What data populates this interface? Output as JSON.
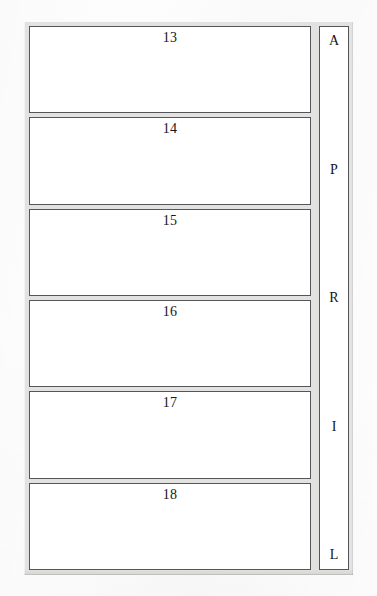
{
  "page": {
    "background_color": "#fdfdfd",
    "frame_color": "#e2e2e1",
    "box_border_color": "#56565a",
    "box_fill_color": "#ffffff",
    "text_color": "#16161a"
  },
  "form": {
    "boxes": [
      {
        "number": "13"
      },
      {
        "number": "14"
      },
      {
        "number": "15"
      },
      {
        "number": "16"
      },
      {
        "number": "17"
      },
      {
        "number": "18"
      }
    ],
    "month_column": {
      "word": "APRIL",
      "letters": [
        {
          "letter": "A"
        },
        {
          "letter": "P"
        },
        {
          "letter": "R"
        },
        {
          "letter": "I"
        },
        {
          "letter": "L"
        }
      ]
    }
  }
}
